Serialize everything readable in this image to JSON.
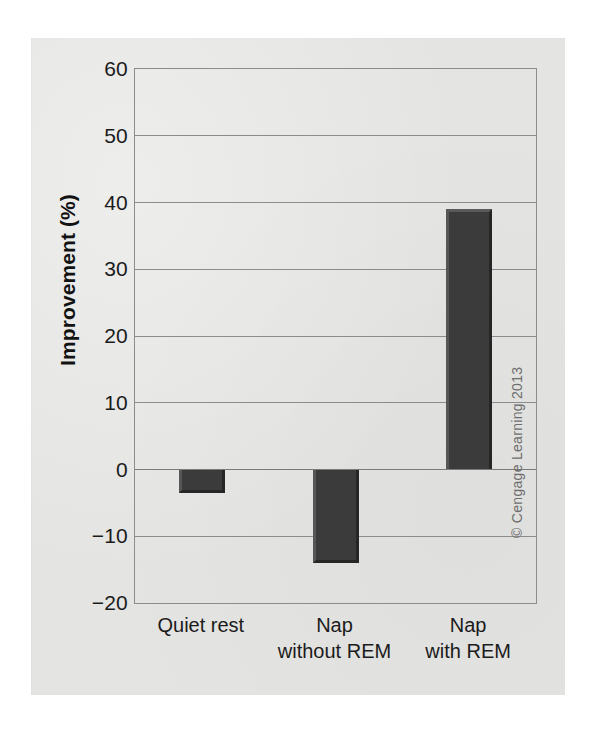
{
  "chart_data": {
    "type": "bar",
    "title": "",
    "subtitle": "",
    "xlabel": "",
    "ylabel": "Improvement (%)",
    "categories": [
      "Quiet rest",
      "Nap\nwithout REM",
      "Nap\nwith REM"
    ],
    "values": [
      -3.5,
      -14,
      39
    ],
    "ylim": [
      -20,
      60
    ],
    "ytick_labels": [
      "60",
      "50",
      "40",
      "30",
      "20",
      "10",
      "0",
      "−10",
      "−20"
    ],
    "ytick_values": [
      60,
      50,
      40,
      30,
      20,
      10,
      0,
      -10,
      -20
    ],
    "grid": true,
    "grid_axis": "y",
    "legend": false,
    "legend_position": "none",
    "bar_color": "#3b3b3b",
    "series": [
      {
        "name": "Improvement",
        "values": [
          -3.5,
          -14,
          39
        ]
      }
    ]
  },
  "figure": {
    "background_color": "#e4e4e2",
    "plot_border_color": "#8c8c8c",
    "credit": "© Cengage Learning 2013"
  }
}
